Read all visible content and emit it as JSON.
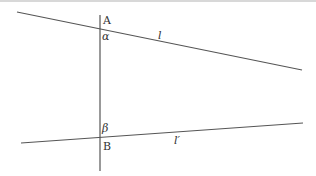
{
  "diagram": {
    "labels": {
      "point_a": "A",
      "point_b": "B",
      "angle_alpha": "α",
      "angle_beta": "β",
      "line_l": "l",
      "line_l_prime": "l′"
    },
    "colors": {
      "line": "#555555",
      "text": "#333333",
      "border": "#d8d8d8"
    }
  }
}
